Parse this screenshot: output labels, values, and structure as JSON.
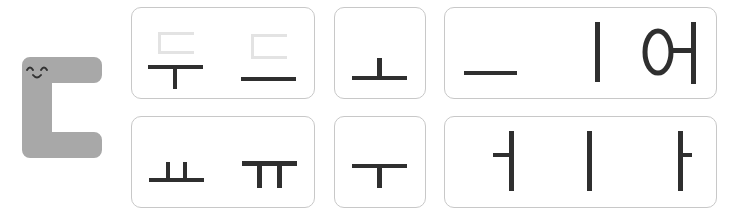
{
  "mascot": {
    "letter": "ㄷ",
    "color": "#a8a8a8",
    "face": "smiling"
  },
  "rows": [
    {
      "cards": [
        {
          "items": [
            "두",
            "드"
          ],
          "note": "ㄷ shown faint above vowel strokes"
        },
        {
          "items": [
            "ㅗ"
          ]
        },
        {
          "items": [
            "ㅡ",
            "ㅣ",
            "어"
          ]
        }
      ]
    },
    {
      "cards": [
        {
          "items": [
            "ㅛ",
            "ㅠ"
          ]
        },
        {
          "items": [
            "ㅜ"
          ]
        },
        {
          "items": [
            "ㅓ",
            "ㅣ",
            "ㅏ"
          ]
        }
      ]
    }
  ],
  "colors": {
    "stroke": "#2f2f2f",
    "faint": "#e3e3e3",
    "border": "#c8c8c8"
  }
}
